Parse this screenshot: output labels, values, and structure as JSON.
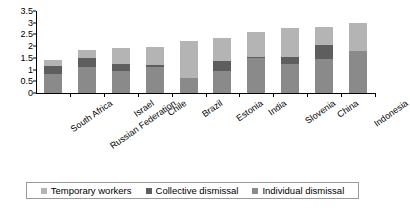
{
  "chart_data": {
    "type": "bar",
    "subtype": "stacked-vertical",
    "title": "",
    "xlabel": "",
    "ylabel": "",
    "ylim": [
      0,
      3.5
    ],
    "ytick_labels": [
      "0",
      "0.5",
      "1",
      "1.5",
      "2",
      "2.5",
      "3",
      "3.5"
    ],
    "ytick_values": [
      0,
      0.5,
      1,
      1.5,
      2,
      2.5,
      3,
      3.5
    ],
    "grid": false,
    "legend_position": "bottom",
    "stack_order_bottom_to_top": [
      "Individual dismissal",
      "Collective dismissal",
      "Temporary workers"
    ],
    "categories": [
      "South Africa",
      "Russian Federation",
      "Israel",
      "Chile",
      "Brazil",
      "Estonia",
      "India",
      "Slovenia",
      "China",
      "Indonesia"
    ],
    "series": [
      {
        "name": "Individual dismissal",
        "color": "#8a8a8a",
        "values": [
          0.81,
          1.13,
          0.94,
          1.13,
          0.63,
          0.94,
          1.5,
          1.25,
          1.44,
          1.78
        ]
      },
      {
        "name": "Collective dismissal",
        "color": "#5e5e5e",
        "values": [
          0.34,
          0.38,
          0.31,
          0.06,
          0.03,
          0.44,
          0.03,
          0.27,
          0.59,
          0.03
        ]
      },
      {
        "name": "Temporary workers",
        "color": "#b4b4b4",
        "values": [
          0.25,
          0.31,
          0.68,
          0.77,
          1.55,
          0.99,
          1.09,
          1.26,
          0.8,
          1.16
        ]
      }
    ],
    "totals": [
      1.4,
      1.82,
      1.93,
      1.96,
      2.21,
      2.37,
      2.62,
      2.78,
      2.83,
      2.97
    ]
  },
  "legend": {
    "items": [
      {
        "label": "Temporary workers",
        "color": "#b4b4b4"
      },
      {
        "label": "Collective dismissal",
        "color": "#5e5e5e"
      },
      {
        "label": "Individual dismissal",
        "color": "#8a8a8a"
      }
    ]
  }
}
